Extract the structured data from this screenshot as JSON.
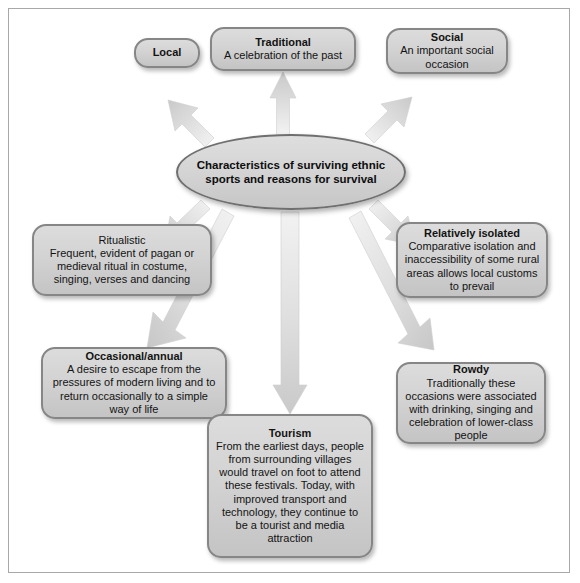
{
  "diagram": {
    "center": {
      "id": "center-node",
      "lines": [
        "Characteristics of surviving",
        "ethnic sports and",
        "reasons for survival"
      ],
      "text": "Characteristics of surviving ethnic sports and reasons for survival"
    },
    "nodes": [
      {
        "id": "local",
        "title": "Local",
        "title_bold": true,
        "body": ""
      },
      {
        "id": "traditional",
        "title": "Traditional",
        "title_bold": true,
        "body": "A celebration of the past"
      },
      {
        "id": "social",
        "title": "Social",
        "title_bold": true,
        "body": "An important social occasion"
      },
      {
        "id": "ritualistic",
        "title": "Ritualistic",
        "title_bold": false,
        "body": "Frequent, evident of pagan or medieval ritual in costume, singing, verses and dancing"
      },
      {
        "id": "relatively-isolated",
        "title": "Relatively isolated",
        "title_bold": true,
        "body": "Comparative isolation and inaccessibility of some rural areas allows local customs to prevail"
      },
      {
        "id": "occasional-annual",
        "title": "Occasional/annual",
        "title_bold": true,
        "body": "A desire to escape from the pressures of modern living and to return occasionally to a simple way of life"
      },
      {
        "id": "rowdy",
        "title": "Rowdy",
        "title_bold": true,
        "body": "Traditionally these occasions were associated with drinking, singing and celebration of lower-class people"
      },
      {
        "id": "tourism",
        "title": "Tourism",
        "title_bold": true,
        "body": "From the earliest days, people from surrounding villages would travel on foot to attend these festivals. Today, with improved transport and technology, they continue to be a tourist and media attraction"
      }
    ],
    "arrows": [
      {
        "id": "arrow-to-traditional",
        "direction": "up"
      },
      {
        "id": "arrow-to-local",
        "direction": "up-left"
      },
      {
        "id": "arrow-to-social",
        "direction": "up-right"
      },
      {
        "id": "arrow-to-ritualistic",
        "direction": "down-left"
      },
      {
        "id": "arrow-to-relatively-isolated",
        "direction": "down-right"
      },
      {
        "id": "arrow-to-occasional-annual",
        "direction": "down-left-long"
      },
      {
        "id": "arrow-to-rowdy",
        "direction": "down-right-long"
      },
      {
        "id": "arrow-to-tourism",
        "direction": "down"
      }
    ]
  },
  "colors": {
    "node_border": "#868686",
    "node_fill_top": "#dcdcdc",
    "node_fill_bottom": "#c4c4c4",
    "arrow_fill": "#d9d9d9",
    "frame_border": "#a8a8a8",
    "text": "#131313"
  }
}
